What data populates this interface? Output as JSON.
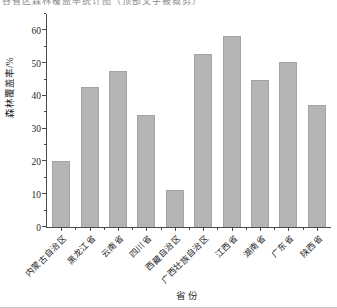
{
  "figure": {
    "clipped_caption_text": "各省区森林覆盖率统计图（顶部文字被裁剪）",
    "background": "#ffffff",
    "bottom_rule_color": "#c9c9c9"
  },
  "chart_data": {
    "type": "bar",
    "title": "",
    "categories": [
      "内蒙古自治区",
      "黑龙江省",
      "云南省",
      "四川省",
      "西藏自治区",
      "广西壮族自治区",
      "江西省",
      "湖南省",
      "广东省",
      "陕西省"
    ],
    "values": [
      20.0,
      42.7,
      47.5,
      34.3,
      11.3,
      52.7,
      58.2,
      44.8,
      50.5,
      37.3
    ],
    "xlabel": "省份",
    "ylabel": "森林覆盖率/%",
    "ylim": [
      0,
      65
    ],
    "yticks_major": [
      0,
      10,
      20,
      30,
      40,
      50,
      60
    ],
    "yticks_minor": [
      5,
      15,
      25,
      35,
      45,
      55,
      65
    ],
    "grid": false,
    "legend": null,
    "bar_color": "#b5b5b5",
    "bar_edge_color": "#a3a3a3",
    "axis_color": "#4a4a4a",
    "text_color": "#1f1f1f"
  }
}
